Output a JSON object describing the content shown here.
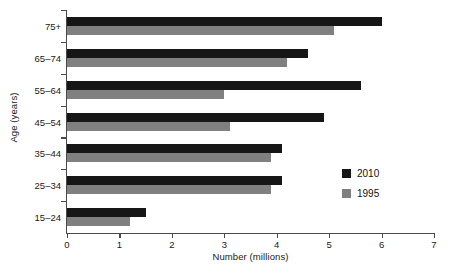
{
  "chart_data": {
    "type": "bar",
    "orientation": "horizontal",
    "title": "",
    "xlabel": "Number (millions)",
    "ylabel": "Age (years)",
    "xlim": [
      0,
      7
    ],
    "xticks": [
      0,
      1,
      2,
      3,
      4,
      5,
      6,
      7
    ],
    "xtick_labels": [
      "0",
      "1",
      "2",
      "3",
      "4",
      "5",
      "6",
      "7"
    ],
    "grid": false,
    "legend_position": "center-right",
    "categories": [
      "15–24",
      "25–34",
      "35–44",
      "45–54",
      "55–64",
      "65–74",
      "75+"
    ],
    "categories_top_down": [
      "75+",
      "65–74",
      "55–64",
      "45–54",
      "35–44",
      "25–34",
      "15–24"
    ],
    "series": [
      {
        "name": "2010",
        "color": "#161616",
        "values_top_down": [
          6.0,
          4.6,
          5.6,
          4.9,
          4.1,
          4.1,
          1.5
        ],
        "values": [
          1.5,
          4.1,
          4.1,
          4.9,
          5.6,
          4.6,
          6.0
        ]
      },
      {
        "name": "1995",
        "color": "#808080",
        "values_top_down": [
          5.1,
          4.2,
          3.0,
          3.1,
          3.9,
          3.9,
          1.2
        ],
        "values": [
          1.2,
          3.9,
          3.9,
          3.1,
          3.0,
          4.2,
          5.1
        ]
      }
    ],
    "legend": [
      {
        "label": "2010",
        "color": "#161616"
      },
      {
        "label": "1995",
        "color": "#808080"
      }
    ]
  }
}
